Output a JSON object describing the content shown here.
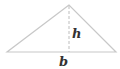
{
  "diagram": {
    "type": "triangle",
    "labels": {
      "height": "h",
      "base": "b"
    },
    "colors": {
      "stroke": "#c8c8c8",
      "text": "#333333",
      "background": "#ffffff"
    },
    "points": {
      "apex": [
        69,
        5
      ],
      "base_left": [
        7,
        52
      ],
      "base_right": [
        116,
        52
      ]
    }
  }
}
